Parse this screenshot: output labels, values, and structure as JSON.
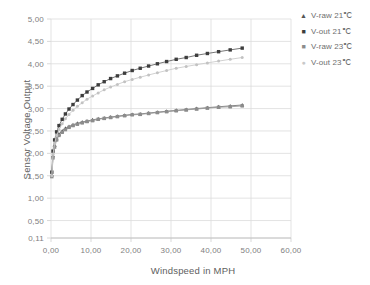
{
  "chart_data": {
    "type": "scatter",
    "title": "",
    "xlabel": "Windspeed in MPH",
    "ylabel": "Sensor Voltage Output",
    "xlim": [
      0,
      60
    ],
    "ylim": [
      0.11,
      5.0
    ],
    "grid": true,
    "legend_position": "right",
    "xticks": [
      "0,00",
      "10,00",
      "20,00",
      "30,00",
      "40,00",
      "50,00",
      "60,00"
    ],
    "xtick_values": [
      0,
      10,
      20,
      30,
      40,
      50,
      60
    ],
    "yticks": [
      "0,11",
      "0,50",
      "1,00",
      "1,50",
      "2,00",
      "2,50",
      "3,00",
      "3,50",
      "4,00",
      "4,50",
      "5,00"
    ],
    "ytick_values": [
      0.11,
      0.5,
      1.0,
      1.5,
      2.0,
      2.5,
      3.0,
      3.5,
      4.0,
      4.5,
      5.0
    ],
    "series": [
      {
        "name": "V-raw 21℃",
        "marker": "triangle",
        "color": "#555555",
        "trend_color": "#777777",
        "points": [
          {
            "x": 0.2,
            "y": 1.52
          },
          {
            "x": 0.5,
            "y": 1.95
          },
          {
            "x": 0.9,
            "y": 2.18
          },
          {
            "x": 1.4,
            "y": 2.33
          },
          {
            "x": 2.0,
            "y": 2.43
          },
          {
            "x": 2.8,
            "y": 2.5
          },
          {
            "x": 3.6,
            "y": 2.56
          },
          {
            "x": 4.5,
            "y": 2.6
          },
          {
            "x": 5.5,
            "y": 2.64
          },
          {
            "x": 6.6,
            "y": 2.67
          },
          {
            "x": 7.8,
            "y": 2.7
          },
          {
            "x": 9.0,
            "y": 2.72
          },
          {
            "x": 10.4,
            "y": 2.75
          },
          {
            "x": 11.8,
            "y": 2.77
          },
          {
            "x": 13.3,
            "y": 2.79
          },
          {
            "x": 14.9,
            "y": 2.81
          },
          {
            "x": 16.6,
            "y": 2.83
          },
          {
            "x": 18.4,
            "y": 2.85
          },
          {
            "x": 20.3,
            "y": 2.87
          },
          {
            "x": 22.3,
            "y": 2.88
          },
          {
            "x": 24.4,
            "y": 2.9
          },
          {
            "x": 26.6,
            "y": 2.92
          },
          {
            "x": 28.9,
            "y": 2.94
          },
          {
            "x": 31.3,
            "y": 2.96
          },
          {
            "x": 33.8,
            "y": 2.98
          },
          {
            "x": 36.4,
            "y": 3.0
          },
          {
            "x": 39.1,
            "y": 3.02
          },
          {
            "x": 41.9,
            "y": 3.04
          },
          {
            "x": 44.8,
            "y": 3.06
          },
          {
            "x": 47.8,
            "y": 3.08
          }
        ],
        "trend": [
          {
            "x": 0.2,
            "y": 1.55
          },
          {
            "x": 6.0,
            "y": 2.62
          },
          {
            "x": 20.0,
            "y": 2.86
          },
          {
            "x": 47.8,
            "y": 3.06
          }
        ]
      },
      {
        "name": "V-out 21℃",
        "marker": "square",
        "color": "#3d3d3d",
        "trend_color": "#666666",
        "points": [
          {
            "x": 0.2,
            "y": 1.58
          },
          {
            "x": 0.5,
            "y": 2.05
          },
          {
            "x": 0.9,
            "y": 2.3
          },
          {
            "x": 1.4,
            "y": 2.48
          },
          {
            "x": 2.0,
            "y": 2.62
          },
          {
            "x": 2.8,
            "y": 2.76
          },
          {
            "x": 3.6,
            "y": 2.88
          },
          {
            "x": 4.5,
            "y": 2.99
          },
          {
            "x": 5.5,
            "y": 3.09
          },
          {
            "x": 6.6,
            "y": 3.19
          },
          {
            "x": 7.8,
            "y": 3.29
          },
          {
            "x": 9.0,
            "y": 3.37
          },
          {
            "x": 10.4,
            "y": 3.45
          },
          {
            "x": 11.8,
            "y": 3.53
          },
          {
            "x": 13.3,
            "y": 3.6
          },
          {
            "x": 14.9,
            "y": 3.67
          },
          {
            "x": 16.6,
            "y": 3.73
          },
          {
            "x": 18.4,
            "y": 3.79
          },
          {
            "x": 20.3,
            "y": 3.85
          },
          {
            "x": 22.3,
            "y": 3.9
          },
          {
            "x": 24.4,
            "y": 3.95
          },
          {
            "x": 26.6,
            "y": 4.0
          },
          {
            "x": 28.9,
            "y": 4.05
          },
          {
            "x": 31.3,
            "y": 4.1
          },
          {
            "x": 33.8,
            "y": 4.14
          },
          {
            "x": 36.4,
            "y": 4.19
          },
          {
            "x": 39.1,
            "y": 4.23
          },
          {
            "x": 41.9,
            "y": 4.27
          },
          {
            "x": 44.8,
            "y": 4.31
          },
          {
            "x": 47.8,
            "y": 4.35
          }
        ],
        "trend": [
          {
            "x": 0.2,
            "y": 1.62
          },
          {
            "x": 6.0,
            "y": 3.12
          },
          {
            "x": 20.0,
            "y": 3.84
          },
          {
            "x": 47.8,
            "y": 4.32
          }
        ]
      },
      {
        "name": "V-raw 23℃",
        "marker": "square",
        "color": "#8c8c8c",
        "trend_color": "#9a9a9a",
        "points": [
          {
            "x": 0.2,
            "y": 1.48
          },
          {
            "x": 0.5,
            "y": 1.9
          },
          {
            "x": 0.9,
            "y": 2.14
          },
          {
            "x": 1.4,
            "y": 2.3
          },
          {
            "x": 2.0,
            "y": 2.4
          },
          {
            "x": 2.8,
            "y": 2.47
          },
          {
            "x": 3.6,
            "y": 2.53
          },
          {
            "x": 4.5,
            "y": 2.58
          },
          {
            "x": 5.5,
            "y": 2.62
          },
          {
            "x": 6.6,
            "y": 2.65
          },
          {
            "x": 7.8,
            "y": 2.68
          },
          {
            "x": 9.0,
            "y": 2.71
          },
          {
            "x": 10.4,
            "y": 2.73
          },
          {
            "x": 11.8,
            "y": 2.76
          },
          {
            "x": 13.3,
            "y": 2.78
          },
          {
            "x": 14.9,
            "y": 2.8
          },
          {
            "x": 16.6,
            "y": 2.82
          },
          {
            "x": 18.4,
            "y": 2.84
          },
          {
            "x": 20.3,
            "y": 2.86
          },
          {
            "x": 22.3,
            "y": 2.87
          },
          {
            "x": 24.4,
            "y": 2.89
          },
          {
            "x": 26.6,
            "y": 2.91
          },
          {
            "x": 28.9,
            "y": 2.93
          },
          {
            "x": 31.3,
            "y": 2.95
          },
          {
            "x": 33.8,
            "y": 2.97
          },
          {
            "x": 36.4,
            "y": 2.99
          },
          {
            "x": 39.1,
            "y": 3.01
          },
          {
            "x": 41.9,
            "y": 3.03
          },
          {
            "x": 44.8,
            "y": 3.04
          },
          {
            "x": 47.8,
            "y": 3.06
          }
        ],
        "trend": [
          {
            "x": 0.2,
            "y": 1.5
          },
          {
            "x": 6.0,
            "y": 2.6
          },
          {
            "x": 20.0,
            "y": 2.85
          },
          {
            "x": 47.8,
            "y": 3.05
          }
        ]
      },
      {
        "name": "V-out 23℃",
        "marker": "dot",
        "color": "#c2c2c2",
        "trend_color": "#cccccc",
        "points": [
          {
            "x": 0.2,
            "y": 1.5
          },
          {
            "x": 0.5,
            "y": 1.98
          },
          {
            "x": 0.9,
            "y": 2.22
          },
          {
            "x": 1.4,
            "y": 2.4
          },
          {
            "x": 2.0,
            "y": 2.53
          },
          {
            "x": 2.8,
            "y": 2.66
          },
          {
            "x": 3.6,
            "y": 2.77
          },
          {
            "x": 4.5,
            "y": 2.87
          },
          {
            "x": 5.5,
            "y": 2.96
          },
          {
            "x": 6.6,
            "y": 3.05
          },
          {
            "x": 7.8,
            "y": 3.13
          },
          {
            "x": 9.0,
            "y": 3.21
          },
          {
            "x": 10.4,
            "y": 3.28
          },
          {
            "x": 11.8,
            "y": 3.35
          },
          {
            "x": 13.3,
            "y": 3.42
          },
          {
            "x": 14.9,
            "y": 3.48
          },
          {
            "x": 16.6,
            "y": 3.54
          },
          {
            "x": 18.4,
            "y": 3.6
          },
          {
            "x": 20.3,
            "y": 3.65
          },
          {
            "x": 22.3,
            "y": 3.7
          },
          {
            "x": 24.4,
            "y": 3.75
          },
          {
            "x": 26.6,
            "y": 3.8
          },
          {
            "x": 28.9,
            "y": 3.85
          },
          {
            "x": 31.3,
            "y": 3.9
          },
          {
            "x": 33.8,
            "y": 3.94
          },
          {
            "x": 36.4,
            "y": 3.98
          },
          {
            "x": 39.1,
            "y": 4.02
          },
          {
            "x": 41.9,
            "y": 4.06
          },
          {
            "x": 44.8,
            "y": 4.1
          },
          {
            "x": 47.8,
            "y": 4.14
          }
        ],
        "trend": [
          {
            "x": 0.2,
            "y": 1.55
          },
          {
            "x": 6.0,
            "y": 2.98
          },
          {
            "x": 20.0,
            "y": 3.64
          },
          {
            "x": 47.8,
            "y": 4.12
          }
        ]
      }
    ]
  },
  "legend": {
    "items": [
      {
        "label": "V-raw 21℃",
        "marker": "▲",
        "color": "#555555"
      },
      {
        "label": "V-out 21℃",
        "marker": "■",
        "color": "#3d3d3d"
      },
      {
        "label": "V-raw 23℃",
        "marker": "■",
        "color": "#8c8c8c"
      },
      {
        "label": "V-out 23℃",
        "marker": "●",
        "color": "#c9c9c9"
      }
    ]
  }
}
